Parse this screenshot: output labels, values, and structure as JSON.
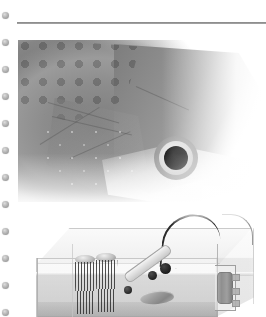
{
  "page": {
    "background_color": "#ffffff",
    "width": 266,
    "height": 317,
    "media": "grayscale-scan"
  },
  "binding_margin": {
    "name": "spiral-binding-holes",
    "hole_count": 12,
    "first_hole_y": 12,
    "spacing_y": 27,
    "hole_color": "#a9a9a9"
  },
  "divider": {
    "name": "horizontal-rule",
    "color": "#6f6f6f",
    "x": 17,
    "y": 22,
    "width": 249
  },
  "figures": [
    {
      "id": "fish-head",
      "type": "photograph",
      "tone": "grayscale",
      "subject": "fish head in right profile",
      "features": [
        "overlapping scales on dorsal area",
        "gill cover (operculum) plate",
        "dark round pupil with pale iris ring",
        "pale lower jaw and belly",
        "light speckles on cheek"
      ],
      "eye": {
        "pupil_color": "#0c0c0c",
        "iris_color": "#dcdcdc",
        "center_x": 158,
        "center_y": 158,
        "pupil_diameter": 24
      },
      "bounds": {
        "x": 18,
        "y": 40,
        "width": 248,
        "height": 162
      }
    },
    {
      "id": "aquarium-setup",
      "type": "photograph",
      "tone": "grayscale",
      "subject": "glass aquarium tank viewed in three-quarter perspective",
      "bounds": {
        "x": 16,
        "y": 212,
        "width": 250,
        "height": 105
      },
      "contents": [
        {
          "name": "spawning-mop-left",
          "description": "tassel of dark strands with pale float cap"
        },
        {
          "name": "spawning-mop-right",
          "description": "tassel of dark strands with pale float cap"
        },
        {
          "name": "probe-device",
          "description": "angled probe or thermometer with dark banded tip"
        },
        {
          "name": "probe-cable",
          "description": "dark cable arcing up and over the tank rim"
        },
        {
          "name": "filter-cylinder",
          "description": "grey cylindrical filter or heater on a bracket"
        },
        {
          "name": "flat-stone",
          "description": "small flat stone resting on the substrate"
        },
        {
          "name": "water-surface",
          "description": "horizontal waterline band across the tank"
        }
      ]
    }
  ]
}
